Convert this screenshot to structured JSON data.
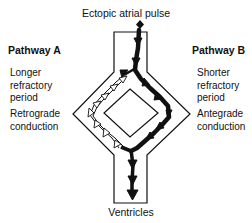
{
  "figure": {
    "title": "Ectopic atrial pulse",
    "footer": "Ventricles"
  },
  "pathway_a": {
    "heading": "Pathway A",
    "property_lines": [
      "Longer",
      "refractory",
      "period"
    ],
    "conduction_lines": [
      "Retrograde",
      "conduction"
    ],
    "arrow_style": "hollow"
  },
  "pathway_b": {
    "heading": "Pathway B",
    "property_lines": [
      "Shorter",
      "refractory",
      "period"
    ],
    "conduction_lines": [
      "Antegrade",
      "conduction"
    ],
    "arrow_style": "solid"
  },
  "colors": {
    "ink": "#111111",
    "background": "#ffffff"
  }
}
